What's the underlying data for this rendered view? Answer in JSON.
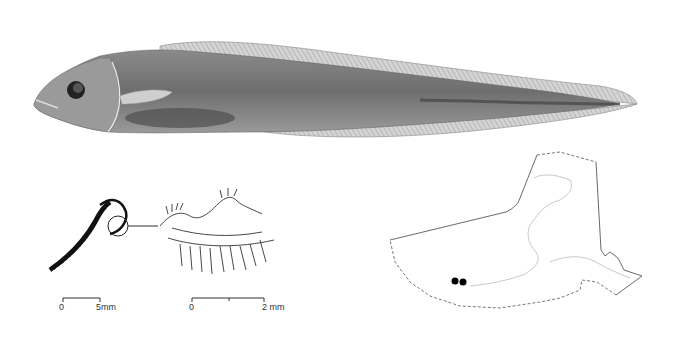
{
  "figure": {
    "fish_illustration": {
      "description": "lateral view of eelpout-like fish"
    },
    "gill_arch": {
      "description": "first gill arch with rakers"
    },
    "gill_detail": {
      "description": "enlarged detail of gill rakers"
    },
    "scale_bar_1": {
      "zero": "0",
      "end": "5mm"
    },
    "scale_bar_2": {
      "zero": "0",
      "end": "2 mm"
    },
    "map": {
      "description": "distribution map of Alaska waters",
      "records": [
        {
          "x": 455,
          "y": 281
        },
        {
          "x": 463,
          "y": 282
        }
      ],
      "dot_color": "#000000"
    }
  }
}
